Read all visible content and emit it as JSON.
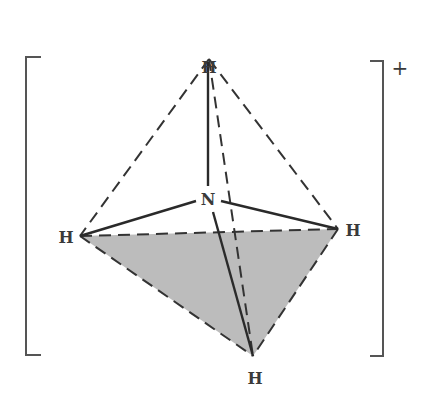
{
  "diagram": {
    "central_atom": {
      "label": "N",
      "x": 208,
      "y": 199
    },
    "atoms": [
      {
        "id": "top",
        "label": "H",
        "x": 209,
        "y": 59,
        "label_x": 209,
        "label_y": 49
      },
      {
        "id": "left",
        "label": "H",
        "x": 80,
        "y": 236,
        "label_x": 66,
        "label_y": 243
      },
      {
        "id": "right",
        "label": "H",
        "x": 338,
        "y": 229,
        "label_x": 353,
        "label_y": 236
      },
      {
        "id": "bottom",
        "label": "H",
        "x": 253,
        "y": 356,
        "label_x": 255,
        "label_y": 384
      }
    ],
    "charge": "+",
    "colors": {
      "line": "#333333",
      "shade": "#bcbcbc",
      "bracket": "#555555"
    }
  }
}
